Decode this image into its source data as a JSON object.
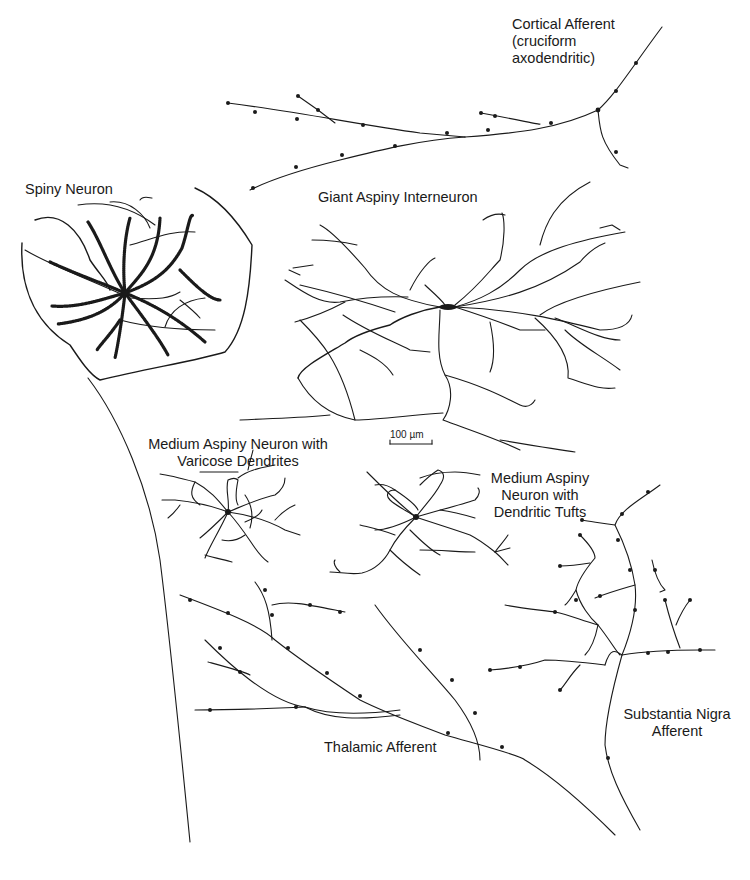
{
  "figure": {
    "labels": {
      "cortical_afferent": [
        "Cortical Afferent",
        "(cruciform",
        "axodendritic)"
      ],
      "spiny_neuron": "Spiny Neuron",
      "giant_aspiny": "Giant Aspiny Interneuron",
      "medium_varicose": [
        "Medium Aspiny Neuron with",
        "Varicose Dendrites"
      ],
      "medium_tufts": [
        "Medium Aspiny",
        "Neuron with",
        "Dendritic Tufts"
      ],
      "thalamic_afferent": "Thalamic Afferent",
      "substantia_nigra": [
        "Substantia Nigra",
        "Afferent"
      ]
    },
    "scale_bar": {
      "label": "100 µm"
    },
    "colors": {
      "ink": "#1a1a1a",
      "background": "#ffffff"
    }
  }
}
